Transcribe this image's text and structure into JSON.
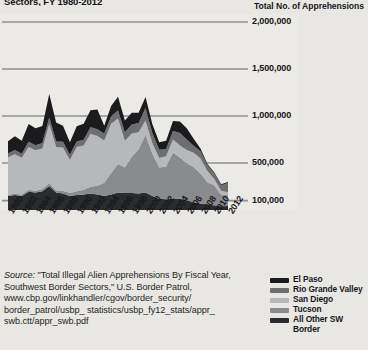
{
  "page": {
    "title_cropped": "Sectors, FY 1980-2012",
    "axis_header": "Total No. of Apprehensions"
  },
  "source": {
    "label": "Source:",
    "line1": "\"Total Illegal Alien Apprehensions By Fiscal",
    "line2": "Year, Southwest Border Sectors,\" U.S. Border Patrol,",
    "line3": "www.cbp.gov/linkhandler/cgov/border_security/",
    "line4": "border_patrol/usbp_ statistics/usbp_fy12_stats/appr_",
    "line5": "swb.ctt/appr_swb.pdf"
  },
  "legend": {
    "items": [
      {
        "label": "El Paso",
        "color": "#1b1b1d"
      },
      {
        "label": "Rio Grande Valley",
        "color": "#6d6e71"
      },
      {
        "label": "San Diego",
        "color": "#b7b8ba"
      },
      {
        "label": "Tucson",
        "color": "#8a8b8e"
      },
      {
        "label": "All Other SW",
        "color": "#2a2b2e"
      }
    ],
    "wrap_label": "Border"
  },
  "chart_data": {
    "type": "area",
    "stacked": true,
    "title": "Sectors, FY 1980-2012",
    "xlabel": "",
    "ylabel": "Total No. of Apprehensions",
    "ylim": [
      0,
      2000000
    ],
    "grid": true,
    "legend_position": "bottom-right",
    "yticks": [
      2000000,
      1500000,
      1000000,
      500000,
      100000
    ],
    "ytick_labels": [
      "2,000,000",
      "1,500,000",
      "1,000,000",
      "500,000",
      "100,000"
    ],
    "x": [
      1980,
      1981,
      1982,
      1983,
      1984,
      1985,
      1986,
      1987,
      1988,
      1989,
      1990,
      1991,
      1992,
      1993,
      1994,
      1995,
      1996,
      1997,
      1998,
      1999,
      2000,
      2001,
      2002,
      2003,
      2004,
      2005,
      2006,
      2007,
      2008,
      2009,
      2010,
      2011,
      2012
    ],
    "xtick_labels": [
      "1980",
      "1982",
      "1984",
      "1986",
      "1988",
      "1990",
      "1992",
      "1994",
      "1996",
      "1998",
      "2000",
      "2002",
      "2004",
      "2006",
      "2008",
      "2010",
      "2012"
    ],
    "series": [
      {
        "name": "All Other SW Border",
        "color": "#2a2b2e",
        "values": [
          150000,
          160000,
          150000,
          195000,
          185000,
          200000,
          255000,
          185000,
          175000,
          150000,
          160000,
          165000,
          175000,
          165000,
          150000,
          165000,
          185000,
          180000,
          180000,
          175000,
          185000,
          150000,
          120000,
          115000,
          120000,
          120000,
          105000,
          80000,
          70000,
          55000,
          50000,
          40000,
          42000
        ]
      },
      {
        "name": "Tucson",
        "color": "#8a8b8e",
        "values": [
          12000,
          14000,
          16000,
          20000,
          20000,
          24000,
          30000,
          25000,
          30000,
          32000,
          40000,
          50000,
          72000,
          92000,
          140000,
          228000,
          305000,
          272000,
          387000,
          470000,
          616000,
          449000,
          333000,
          347000,
          491000,
          439000,
          392000,
          378000,
          317000,
          241000,
          212000,
          123000,
          120000
        ]
      },
      {
        "name": "San Diego",
        "color": "#b7b8ba",
        "values": [
          400000,
          420000,
          390000,
          455000,
          430000,
          430000,
          629000,
          460000,
          460000,
          350000,
          470000,
          470000,
          565000,
          531000,
          450000,
          524000,
          484000,
          284000,
          248000,
          182000,
          152000,
          110000,
          100000,
          111000,
          138000,
          127000,
          142000,
          152000,
          162000,
          118000,
          68000,
          42000,
          28000
        ]
      },
      {
        "name": "Rio Grande Valley",
        "color": "#6d6e71",
        "values": [
          40000,
          45000,
          42000,
          55000,
          55000,
          60000,
          70000,
          60000,
          60000,
          55000,
          60000,
          62000,
          68000,
          72000,
          75000,
          80000,
          85000,
          90000,
          95000,
          98000,
          133000,
          107000,
          89000,
          77000,
          92000,
          134000,
          110000,
          73000,
          75000,
          61000,
          60000,
          59000,
          98000
        ]
      },
      {
        "name": "El Paso",
        "color": "#1b1b1d",
        "values": [
          130000,
          145000,
          140000,
          190000,
          180000,
          180000,
          250000,
          200000,
          170000,
          135000,
          160000,
          170000,
          180000,
          210000,
          80000,
          110000,
          145000,
          125000,
          125000,
          110000,
          116000,
          95000,
          78000,
          88000,
          105000,
          122000,
          122000,
          75000,
          30000,
          15000,
          12000,
          10000,
          9000
        ]
      }
    ]
  }
}
